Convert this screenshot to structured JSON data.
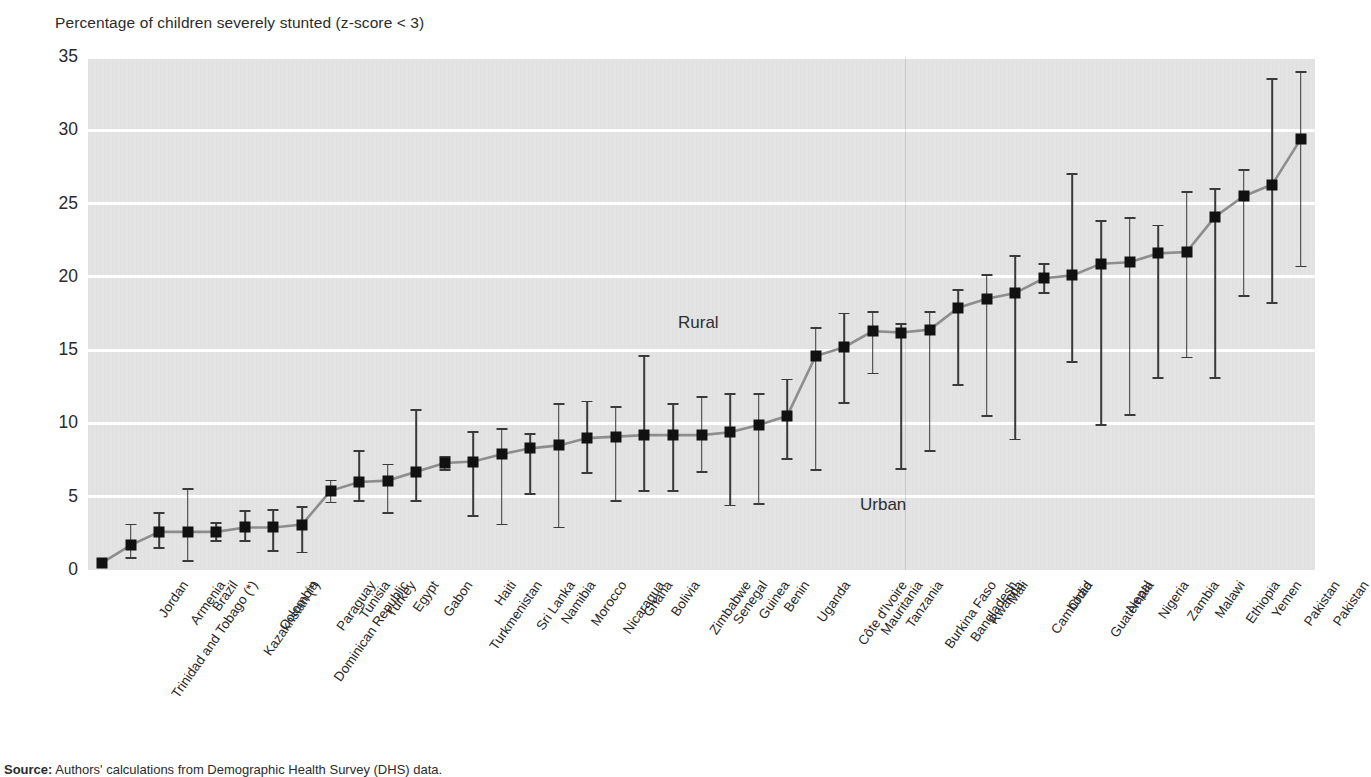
{
  "figure": {
    "title": "Percentage of children severely stunted (z-score < 3)",
    "source_label": "Source:",
    "source_text": " Authors' calculations from Demographic Health Survey (DHS) data.",
    "annotations": {
      "rural": "Rural",
      "urban": "Urban"
    }
  },
  "axis": {
    "y_ticks": [
      "0",
      "5",
      "10",
      "15",
      "20",
      "25",
      "30",
      "35"
    ]
  },
  "chart_data": {
    "type": "scatter",
    "title": "Percentage of children severely stunted (z-score < 3)",
    "xlabel": "",
    "ylabel": "Percentage of children severely stunted (z-score < 3)",
    "ylim": [
      0,
      35
    ],
    "ytick_step": 5,
    "grid": true,
    "legend_position": "in-plot annotations",
    "annotations": [
      {
        "text": "Rural",
        "meaning": "upper end of each vertical range"
      },
      {
        "text": "Urban",
        "meaning": "lower end of each vertical range"
      }
    ],
    "categories": [
      "Trinidad and Tobago (*)",
      "Jordan",
      "Armenia",
      "Brazil",
      "Kazakhstan (*)",
      "Colombia",
      "Dominican Republic",
      "Paraguay",
      "Tunisia",
      "Turkey",
      "Egypt",
      "Gabon",
      "Turkmenistan",
      "Haiti",
      "Sri Lanka",
      "Namibia",
      "Morocco",
      "Nicaragua",
      "Ghana",
      "Bolivia",
      "Zimbabwe",
      "Senegal",
      "Guinea",
      "Benin",
      "Uganda",
      "Côte d'Ivoire",
      "Mauritania",
      "Tanzania",
      "Burkina Faso",
      "Bangladesh",
      "Rwanda",
      "Mali",
      "Cambodia",
      "Chad",
      "Guatemala",
      "Nepal",
      "Nigeria",
      "Zambia",
      "Malawi",
      "Ethiopia",
      "Yemen",
      "Pakistan"
    ],
    "series": [
      {
        "name": "National (marker)",
        "values": [
          0.5,
          1.7,
          2.6,
          2.6,
          2.6,
          2.9,
          2.9,
          3.1,
          5.4,
          6.0,
          6.1,
          6.7,
          7.3,
          7.4,
          7.9,
          8.3,
          8.5,
          9.0,
          9.1,
          9.2,
          9.2,
          9.2,
          9.4,
          9.9,
          10.5,
          14.6,
          15.2,
          16.3,
          16.2,
          16.4,
          17.9,
          18.5,
          18.9,
          19.9,
          20.1,
          20.9,
          21.0,
          21.6,
          21.7,
          24.1,
          25.5,
          26.3
        ]
      },
      {
        "name": "Rural (upper bound)",
        "values": [
          0.5,
          3.1,
          3.9,
          5.5,
          3.2,
          4.0,
          4.1,
          4.3,
          6.1,
          8.1,
          7.2,
          10.9,
          7.7,
          9.4,
          9.6,
          9.3,
          11.3,
          11.5,
          11.1,
          14.6,
          11.3,
          11.8,
          12.0,
          12.0,
          13.0,
          16.5,
          17.5,
          17.6,
          16.8,
          17.6,
          19.1,
          20.1,
          21.4,
          20.9,
          27.0,
          23.8,
          24.0,
          23.5,
          25.8,
          26.0,
          27.3,
          33.5
        ]
      },
      {
        "name": "Urban (lower bound)",
        "values": [
          0.5,
          0.8,
          1.5,
          0.6,
          2.0,
          2.0,
          1.3,
          1.2,
          4.6,
          4.7,
          3.9,
          4.7,
          6.8,
          3.7,
          3.1,
          5.2,
          2.9,
          6.6,
          4.7,
          5.4,
          5.4,
          6.7,
          4.4,
          4.5,
          7.6,
          6.8,
          11.4,
          13.4,
          6.9,
          8.1,
          12.6,
          10.5,
          8.9,
          18.9,
          14.2,
          9.9,
          10.6,
          13.1,
          14.5,
          13.1,
          18.7,
          18.2
        ]
      }
    ],
    "last_point": {
      "name": "Pakistan",
      "value": 29.4,
      "rural": 34.0,
      "urban": 20.7
    }
  }
}
